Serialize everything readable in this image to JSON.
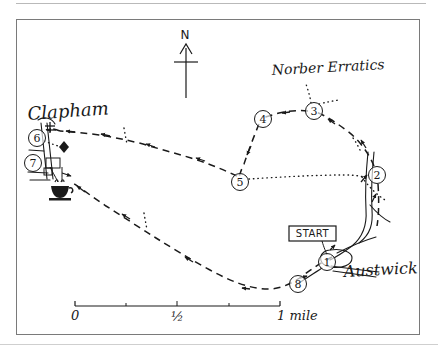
{
  "figure": {
    "kind": "hand-drawn walking route map",
    "region": "Austwick and Clapham, Yorkshire Dales"
  },
  "compass": {
    "label": "N",
    "name": "north-arrow"
  },
  "place_labels": [
    {
      "id": "clapham",
      "text": "Clapham",
      "x": 28,
      "y": 115,
      "size": 16,
      "rotate": -4
    },
    {
      "id": "austwick",
      "text": "Austwick",
      "x": 345,
      "y": 275,
      "size": 15,
      "rotate": -3
    },
    {
      "id": "norber",
      "text": "Norber Erratics",
      "x": 272,
      "y": 72,
      "size": 13,
      "rotate": -3
    }
  ],
  "start_marker": {
    "label": "START",
    "x": 289,
    "y": 226,
    "width": 46,
    "height": 15
  },
  "waypoints": [
    {
      "number": "1",
      "x": 327,
      "y": 262,
      "r": 8
    },
    {
      "number": "2",
      "x": 376,
      "y": 175,
      "r": 8
    },
    {
      "number": "3",
      "x": 314,
      "y": 110,
      "r": 8
    },
    {
      "number": "4",
      "x": 262,
      "y": 118,
      "r": 8
    },
    {
      "number": "5",
      "x": 239,
      "y": 181,
      "r": 8
    },
    {
      "number": "6",
      "x": 37,
      "y": 138,
      "r": 8
    },
    {
      "number": "7",
      "x": 33,
      "y": 163,
      "r": 8
    },
    {
      "number": "8",
      "x": 298,
      "y": 283,
      "r": 8
    }
  ],
  "symbols": [
    {
      "id": "church-cross",
      "name": "church-cross-icon",
      "x": 50,
      "y": 128
    },
    {
      "id": "viewpoint-diamond",
      "name": "diamond-marker-icon",
      "x": 63,
      "y": 146
    },
    {
      "id": "refreshments-cup",
      "name": "teacup-icon",
      "x": 59,
      "y": 191
    }
  ],
  "scale_bar": {
    "x": 75,
    "y": 306,
    "length": 205,
    "labels": [
      {
        "text": "0",
        "pos": 0.0
      },
      {
        "text": "½",
        "pos": 0.5
      },
      {
        "text": "1 mile",
        "pos": 1.0
      }
    ],
    "tick_positions": [
      0.0,
      0.25,
      0.5,
      0.75,
      1.0
    ]
  },
  "routes": {
    "outward_dashed": "M 330 256 C 320 262 310 268 300 276 C 290 283 280 288 268 288 C 250 288 230 281 210 270 C 190 259 172 248 156 238 C 140 228 122 216 106 206 C 94 198 82 189 72 183",
    "return_dashed": "M 239 175 C 224 168 208 162 192 157 C 176 152 160 148 144 143 C 128 139 114 136 100 134 C 86 132 72 131 60 130",
    "norber_loop": "M 376 168 C 372 158 362 142 346 130 C 334 121 324 115 316 112 C 306 110 294 110 284 112 C 274 114 268 116 262 118 C 256 125 250 140 245 155 C 242 165 240 172 239 178",
    "link_2_to_1": "M 372 182 C 372 198 372 215 373 228 C 374 238 370 246 356 252 C 346 256 336 259 330 260",
    "dotted_5_to_2": "M 248 181 L 360 176",
    "dotted_2_diag": "M 360 176 L 384 198",
    "dotted_norber_spur": "M 312 102 L 308 86",
    "dotted_clapham": "M 45 141 L 60 147"
  },
  "roads": {
    "austwick_vertical": "M 368 152 C 366 172 365 192 366 210 C 367 224 364 236 352 246 C 344 252 336 257 330 260",
    "austwick_vertical_b": "M 373 152 C 371 172 370 192 371 210 C 372 223 370 234 358 243",
    "junction_east": "M 330 266 C 344 268 360 270 378 272",
    "junction_west": "M 322 268 C 312 274 304 279 296 284",
    "junction_ne": "M 336 254 C 348 248 362 242 376 238",
    "clapham_road_a": "M 40 124 C 42 142 44 160 46 178",
    "clapham_road_b": "M 46 124 C 48 142 50 160 52 178"
  }
}
